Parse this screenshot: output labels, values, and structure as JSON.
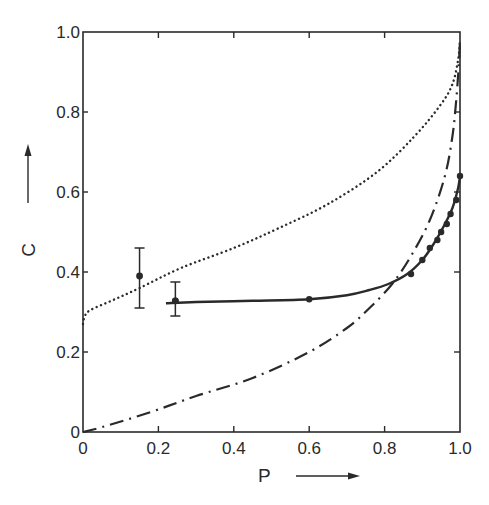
{
  "chart_data": {
    "type": "line",
    "title": "",
    "xlabel": "P",
    "ylabel": "C",
    "xlim": [
      0,
      1.0
    ],
    "ylim": [
      0,
      1.0
    ],
    "grid": false,
    "legend": null,
    "x_ticks": [
      "0",
      "0.2",
      "0.4",
      "0.6",
      "0.8",
      "1.0"
    ],
    "y_ticks": [
      "0",
      "0.2",
      "0.4",
      "0.6",
      "0.8",
      "1.0"
    ],
    "x_tick_values": [
      0,
      0.2,
      0.4,
      0.6,
      0.8,
      1.0
    ],
    "y_tick_values": [
      0,
      0.2,
      0.4,
      0.6,
      0.8,
      1.0
    ],
    "series": [
      {
        "name": "dotted-curve",
        "style": "dotted",
        "points": [
          [
            0,
            0.27
          ],
          [
            0.005,
            0.29
          ],
          [
            0.02,
            0.305
          ],
          [
            0.08,
            0.33
          ],
          [
            0.15,
            0.36
          ],
          [
            0.26,
            0.41
          ],
          [
            0.4,
            0.46
          ],
          [
            0.52,
            0.51
          ],
          [
            0.65,
            0.57
          ],
          [
            0.78,
            0.65
          ],
          [
            0.88,
            0.74
          ],
          [
            0.95,
            0.82
          ],
          [
            0.98,
            0.87
          ],
          [
            0.995,
            0.93
          ],
          [
            1.0,
            0.98
          ]
        ]
      },
      {
        "name": "dash-dot-curve",
        "style": "dashdot",
        "points": [
          [
            0,
            0
          ],
          [
            0.05,
            0.012
          ],
          [
            0.18,
            0.05
          ],
          [
            0.3,
            0.09
          ],
          [
            0.45,
            0.135
          ],
          [
            0.6,
            0.2
          ],
          [
            0.7,
            0.26
          ],
          [
            0.76,
            0.31
          ],
          [
            0.82,
            0.37
          ],
          [
            0.87,
            0.44
          ],
          [
            0.92,
            0.53
          ],
          [
            0.96,
            0.64
          ],
          [
            0.98,
            0.74
          ],
          [
            0.99,
            0.83
          ],
          [
            0.997,
            0.92
          ],
          [
            1.0,
            0.98
          ]
        ]
      },
      {
        "name": "solid-curve",
        "style": "solid",
        "points": [
          [
            0.22,
            0.322
          ],
          [
            0.3,
            0.325
          ],
          [
            0.45,
            0.328
          ],
          [
            0.6,
            0.332
          ],
          [
            0.7,
            0.342
          ],
          [
            0.76,
            0.355
          ],
          [
            0.81,
            0.37
          ],
          [
            0.86,
            0.395
          ],
          [
            0.9,
            0.43
          ],
          [
            0.93,
            0.47
          ],
          [
            0.96,
            0.52
          ],
          [
            0.98,
            0.56
          ],
          [
            0.995,
            0.61
          ],
          [
            1.0,
            0.64
          ]
        ]
      }
    ],
    "markers": [
      {
        "x": 0.245,
        "y": 0.328
      },
      {
        "x": 0.6,
        "y": 0.332
      },
      {
        "x": 0.87,
        "y": 0.395
      },
      {
        "x": 0.9,
        "y": 0.43
      },
      {
        "x": 0.92,
        "y": 0.46
      },
      {
        "x": 0.94,
        "y": 0.48
      },
      {
        "x": 0.95,
        "y": 0.5
      },
      {
        "x": 0.965,
        "y": 0.52
      },
      {
        "x": 0.975,
        "y": 0.545
      },
      {
        "x": 0.99,
        "y": 0.58
      },
      {
        "x": 1.0,
        "y": 0.64
      }
    ],
    "error_bars": [
      {
        "x": 0.15,
        "y": 0.39,
        "low": 0.31,
        "high": 0.46
      },
      {
        "x": 0.245,
        "y": 0.328,
        "low": 0.29,
        "high": 0.375
      }
    ]
  },
  "axes": {
    "x_label": "P",
    "y_label": "C"
  }
}
